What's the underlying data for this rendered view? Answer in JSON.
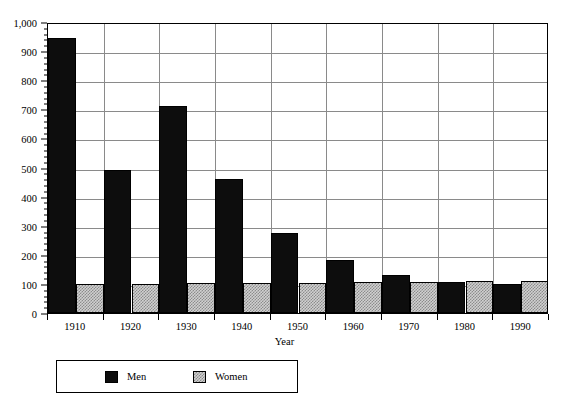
{
  "chart_data": {
    "type": "bar",
    "title": "",
    "xlabel": "Year",
    "ylabel": "",
    "categories": [
      "1910",
      "1920",
      "1930",
      "1940",
      "1950",
      "1960",
      "1970",
      "1980",
      "1990"
    ],
    "series": [
      {
        "name": "Men",
        "color": "#0d0d0d",
        "values": [
          945,
          490,
          710,
          462,
          276,
          182,
          132,
          105,
          98
        ]
      },
      {
        "name": "Women",
        "color": "#d0d0d0",
        "values": [
          100,
          101,
          102,
          102,
          104,
          105,
          107,
          110,
          111
        ]
      }
    ],
    "ylim": [
      0,
      1000
    ],
    "ytick_values": [
      0,
      100,
      200,
      300,
      400,
      500,
      600,
      700,
      800,
      900,
      1000
    ],
    "ytick_labels": [
      "0",
      "100",
      "200",
      "300",
      "400",
      "500",
      "600",
      "700",
      "800",
      "900",
      "1,000"
    ],
    "grid": "horizontal-and-vertical",
    "legend_position": "below-axis-left",
    "legend_entries": [
      "Men",
      "Women"
    ]
  },
  "axis": {
    "x_title": "Year"
  },
  "legend": {
    "men_label": "Men",
    "women_label": "Women"
  }
}
